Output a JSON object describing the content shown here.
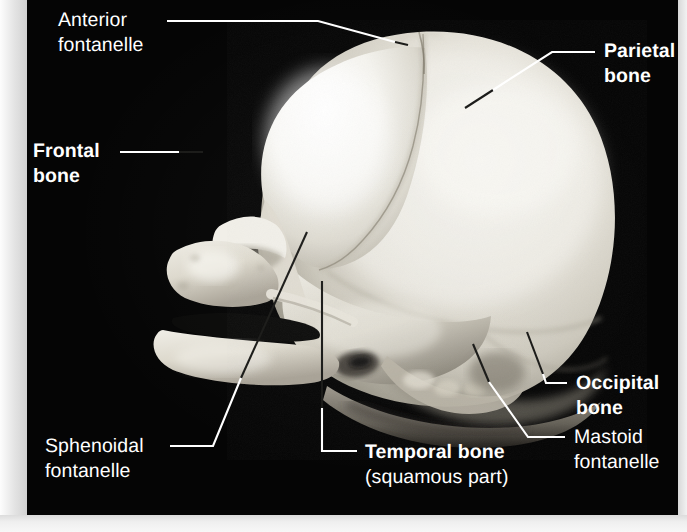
{
  "figure": {
    "type": "anatomical-photograph",
    "background_color": "#050505",
    "page_color": "#efefef",
    "label_color": "#ffffff",
    "leader_color_on_black": "#ffffff",
    "leader_color_on_bone": "#111111"
  },
  "labels": {
    "anterior_fontanelle": {
      "line1": "Anterior",
      "line2": "fontanelle",
      "weight": "regular"
    },
    "parietal_bone": {
      "line1": "Parietal",
      "line2": "bone",
      "weight": "bold"
    },
    "frontal_bone": {
      "line1": "Frontal",
      "line2": "bone",
      "weight": "bold"
    },
    "occipital_bone": {
      "line1": "Occipital",
      "line2": "bone",
      "weight": "bold"
    },
    "mastoid_fontanelle": {
      "line1": "Mastoid",
      "line2": "fontanelle",
      "weight": "regular"
    },
    "sphenoidal_fontanelle": {
      "line1": "Sphenoidal",
      "line2": "fontanelle",
      "weight": "regular"
    },
    "temporal_bone": {
      "line1": "Temporal bone",
      "line2": "(squamous part)",
      "weight": "bold-with-regular-subtitle"
    }
  }
}
